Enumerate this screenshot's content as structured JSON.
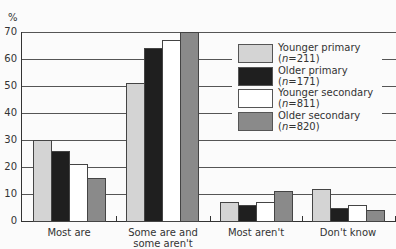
{
  "chart_data": {
    "type": "bar",
    "title": "",
    "xlabel": "",
    "ylabel": "%",
    "ylim": [
      0,
      70
    ],
    "yticks": [
      0,
      10,
      20,
      30,
      40,
      50,
      60,
      70
    ],
    "grid": true,
    "legend_position": "upper right (inside plot)",
    "categories": [
      "Most are",
      "Some are and some aren't",
      "Most aren't",
      "Don't know"
    ],
    "category_lines": [
      [
        "Most are"
      ],
      [
        "Some are and",
        "some aren't"
      ],
      [
        "Most aren't"
      ],
      [
        "Don't know"
      ]
    ],
    "series": [
      {
        "name": "Younger primary",
        "n": "211",
        "color": "#d4d4d4",
        "values": [
          30,
          51,
          7,
          12
        ]
      },
      {
        "name": "Older primary",
        "n": "171",
        "color": "#1f1f1f",
        "values": [
          26,
          64,
          6,
          5
        ]
      },
      {
        "name": "Younger secondary",
        "n": "811",
        "color": "#ffffff",
        "values": [
          21,
          67,
          7,
          6
        ]
      },
      {
        "name": "Older secondary",
        "n": "820",
        "color": "#8a8a8a",
        "values": [
          16,
          70,
          11,
          4
        ]
      }
    ]
  },
  "labels": {
    "y_unit": "%",
    "legend": [
      {
        "line1": "Younger primary",
        "n_prefix": "(",
        "n_var": "n",
        "n_eq": "=211)"
      },
      {
        "line1": "Older primary",
        "n_prefix": "(",
        "n_var": "n",
        "n_eq": "=171)"
      },
      {
        "line1": "Younger secondary",
        "n_prefix": "(",
        "n_var": "n",
        "n_eq": "=811)"
      },
      {
        "line1": "Older secondary",
        "n_prefix": "(",
        "n_var": "n",
        "n_eq": "=820)"
      }
    ]
  }
}
